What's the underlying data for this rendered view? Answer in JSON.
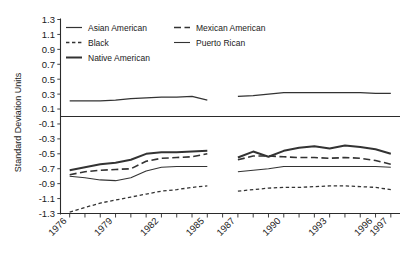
{
  "chart_data": {
    "type": "line",
    "title": "",
    "xlabel": "",
    "ylabel": "Standard Deviation Units",
    "ylim": [
      -1.3,
      1.3
    ],
    "ytick_labels": [
      "1.3",
      "1.1",
      "0.9",
      "0.7",
      "0.5",
      "0.3",
      "0.1",
      "-0.1",
      "-0.3",
      "-0.5",
      "-0.7",
      "-0.9",
      "-1.1",
      "-1.3"
    ],
    "ytick_values": [
      1.3,
      1.1,
      0.9,
      0.7,
      0.5,
      0.3,
      0.1,
      -0.1,
      -0.3,
      -0.5,
      -0.7,
      -0.9,
      -1.1,
      -1.3
    ],
    "xtick_labels": [
      "1976",
      "1979",
      "1982",
      "1985",
      "1987",
      "1990",
      "1993",
      "1996",
      "1997"
    ],
    "xtick_values": [
      1976,
      1979,
      1982,
      1985,
      1987,
      1990,
      1993,
      1996,
      1997
    ],
    "xlim": [
      1975.4,
      1997.6
    ],
    "grid": false,
    "zero_line": true,
    "legend_position": "top-inside",
    "segment_gap": {
      "from": 1985,
      "to": 1986.6
    },
    "series": [
      {
        "name": "Asian American",
        "style": "solid",
        "width": 1.2,
        "color": "#333333",
        "x": [
          1976,
          1977,
          1978,
          1979,
          1980,
          1981,
          1982,
          1983,
          1984,
          1985,
          1987,
          1988,
          1989,
          1990,
          1991,
          1992,
          1993,
          1994,
          1995,
          1996,
          1997
        ],
        "values": [
          0.21,
          0.21,
          0.21,
          0.22,
          0.24,
          0.25,
          0.26,
          0.26,
          0.27,
          0.22,
          0.27,
          0.28,
          0.3,
          0.32,
          0.32,
          0.32,
          0.32,
          0.32,
          0.32,
          0.31,
          0.31
        ]
      },
      {
        "name": "Native American",
        "style": "solid",
        "width": 2.0,
        "color": "#333333",
        "x": [
          1976,
          1977,
          1978,
          1979,
          1980,
          1981,
          1982,
          1983,
          1984,
          1985,
          1987,
          1988,
          1989,
          1990,
          1991,
          1992,
          1993,
          1994,
          1995,
          1996,
          1997
        ],
        "values": [
          -0.72,
          -0.68,
          -0.64,
          -0.62,
          -0.58,
          -0.5,
          -0.48,
          -0.48,
          -0.47,
          -0.46,
          -0.55,
          -0.47,
          -0.54,
          -0.46,
          -0.42,
          -0.4,
          -0.43,
          -0.39,
          -0.41,
          -0.44,
          -0.5
        ]
      },
      {
        "name": "Mexican American",
        "style": "long-dash",
        "width": 1.6,
        "color": "#333333",
        "x": [
          1976,
          1977,
          1978,
          1979,
          1980,
          1981,
          1982,
          1983,
          1984,
          1985,
          1987,
          1988,
          1989,
          1990,
          1991,
          1992,
          1993,
          1994,
          1995,
          1996,
          1997
        ],
        "values": [
          -0.78,
          -0.74,
          -0.72,
          -0.71,
          -0.7,
          -0.6,
          -0.56,
          -0.55,
          -0.54,
          -0.5,
          -0.58,
          -0.53,
          -0.53,
          -0.54,
          -0.55,
          -0.55,
          -0.56,
          -0.55,
          -0.56,
          -0.59,
          -0.64
        ]
      },
      {
        "name": "Puerto Rican",
        "style": "solid",
        "width": 1.1,
        "color": "#333333",
        "x": [
          1976,
          1977,
          1978,
          1979,
          1980,
          1981,
          1982,
          1983,
          1984,
          1985,
          1987,
          1988,
          1989,
          1990,
          1991,
          1992,
          1993,
          1994,
          1995,
          1996,
          1997
        ],
        "values": [
          -0.8,
          -0.82,
          -0.85,
          -0.86,
          -0.82,
          -0.73,
          -0.68,
          -0.67,
          -0.67,
          -0.67,
          -0.74,
          -0.72,
          -0.7,
          -0.67,
          -0.67,
          -0.67,
          -0.67,
          -0.67,
          -0.67,
          -0.67,
          -0.68
        ]
      },
      {
        "name": "Black",
        "style": "short-dash",
        "width": 1.3,
        "color": "#333333",
        "x": [
          1976,
          1977,
          1978,
          1979,
          1980,
          1981,
          1982,
          1983,
          1984,
          1985,
          1987,
          1988,
          1989,
          1990,
          1991,
          1992,
          1993,
          1994,
          1995,
          1996,
          1997
        ],
        "values": [
          -1.28,
          -1.22,
          -1.16,
          -1.12,
          -1.08,
          -1.04,
          -1.0,
          -0.98,
          -0.95,
          -0.93,
          -1.0,
          -0.98,
          -0.96,
          -0.95,
          -0.95,
          -0.94,
          -0.93,
          -0.93,
          -0.94,
          -0.95,
          -0.98
        ]
      }
    ]
  },
  "legend": {
    "entries": [
      {
        "label": "Asian American"
      },
      {
        "label": "Mexican American"
      },
      {
        "label": "Black"
      },
      {
        "label": "Puerto Rican"
      },
      {
        "label": "Native American"
      }
    ]
  }
}
